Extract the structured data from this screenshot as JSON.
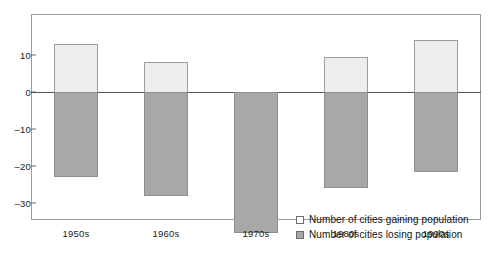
{
  "chart_data": {
    "type": "bar",
    "title": "",
    "subtitle": "",
    "xlabel": "",
    "ylabel": "",
    "categories": [
      "1950s",
      "1960s",
      "1970s",
      "1980s",
      "1990s"
    ],
    "series": [
      {
        "name": "Number of cities gaining population",
        "color": "#eceded",
        "values": [
          13,
          8,
          0,
          9.5,
          14
        ]
      },
      {
        "name": "Number of cities losing population",
        "color": "#a8a8a8",
        "values": [
          -23,
          -28,
          -38,
          -26,
          -21.5
        ]
      }
    ],
    "ylim": [
      -38,
      18
    ],
    "yticks": [
      10,
      0,
      -10,
      -20,
      -30
    ],
    "ytick_labels": [
      "10",
      "0",
      "–10",
      "–20",
      "–30"
    ],
    "grid": false,
    "legend_position": "inside-bottom-right",
    "zero_line": true,
    "frame": true
  },
  "legend": {
    "items": [
      {
        "label": "Number of cities gaining population",
        "swatch": "gaining"
      },
      {
        "label": "Number of cities losing population",
        "swatch": "losing"
      }
    ]
  },
  "colors": {
    "gaining": "#eceded",
    "losing": "#a8a8a8",
    "frame": "#9a9a9a",
    "zero_line": "#555555",
    "text": "#1a1a1a",
    "background": "#ffffff"
  }
}
